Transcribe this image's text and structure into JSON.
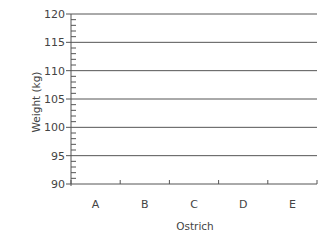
{
  "chart_data": {
    "type": "bar",
    "title": "",
    "xlabel": "Ostrich",
    "ylabel": "Weight (kg)",
    "categories": [
      "A",
      "B",
      "C",
      "D",
      "E"
    ],
    "values": [
      null,
      null,
      null,
      null,
      null
    ],
    "ylim": [
      90,
      120
    ],
    "yticks": [
      90,
      95,
      100,
      105,
      110,
      115,
      120
    ],
    "y_minor_step": 1,
    "grid": true,
    "legend": "none",
    "note": "Empty chart template - no bars drawn"
  },
  "colors": {
    "axis": "#555555",
    "grid": "#555555",
    "text": "#444444"
  }
}
